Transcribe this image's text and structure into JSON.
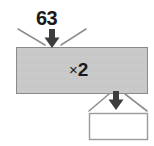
{
  "diagram": {
    "type": "function-machine",
    "title": "",
    "background_color": "#ffffff",
    "input": {
      "label": "63",
      "arrow": "down-arrow"
    },
    "machine": {
      "operation_symbol": "×",
      "operation_operand": "2",
      "fill_color": "#c9c9c9",
      "border_color": "#8a8a8a"
    },
    "output": {
      "label": "",
      "arrow": "down-arrow",
      "box_fill_color": "#ffffff",
      "box_border_color": "#9a9a9a"
    }
  }
}
